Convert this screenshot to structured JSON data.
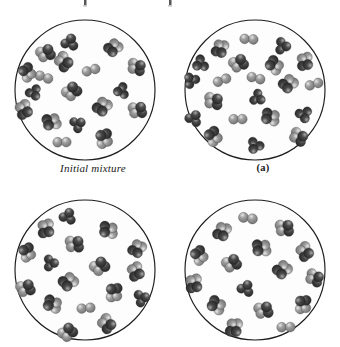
{
  "figure": {
    "kind": "molecular-illustration",
    "background_color": "#ffffff",
    "vessel_outline_color": "#1d1d1d",
    "vessel_fill_color": "#fdfdfd",
    "atom_light_color": "#9e9e9e",
    "atom_dark_color": "#4a4a4a",
    "atom_outline_color": "#2b2b2b",
    "panels": [
      {
        "id": "panel-initial",
        "label": "Initial mixture",
        "label_style": "italic",
        "x": 8,
        "y": 12,
        "molecules": [
          {
            "cx": 54,
            "cy": 22,
            "type": "dark-triatomic",
            "r": 6.0,
            "rot": 15
          },
          {
            "cx": 30,
            "cy": 33,
            "type": "mixed-tetratomic",
            "r": 6.2,
            "rot": 40
          },
          {
            "cx": 97,
            "cy": 28,
            "type": "mixed-tetratomic",
            "r": 6.0,
            "rot": 200
          },
          {
            "cx": 48,
            "cy": 42,
            "type": "mixed-tetratomic",
            "r": 6.3,
            "rot": 110
          },
          {
            "cx": 28,
            "cy": 57,
            "type": "light-diatomic",
            "r": 6.0,
            "rot": 25
          },
          {
            "cx": 11,
            "cy": 52,
            "type": "mixed-tetratomic",
            "r": 6.0,
            "rot": 300
          },
          {
            "cx": 75,
            "cy": 50,
            "type": "light-diatomic",
            "r": 6.0,
            "rot": 350
          },
          {
            "cx": 121,
            "cy": 47,
            "type": "mixed-tetratomic",
            "r": 6.0,
            "rot": 75
          },
          {
            "cx": 18,
            "cy": 73,
            "type": "dark-triatomic",
            "r": 5.6,
            "rot": 150
          },
          {
            "cx": 56,
            "cy": 71,
            "type": "mixed-tetratomic",
            "r": 6.3,
            "rot": 20
          },
          {
            "cx": 105,
            "cy": 71,
            "type": "dark-triatomic",
            "r": 5.6,
            "rot": 260
          },
          {
            "cx": 8,
            "cy": 90,
            "type": "mixed-tetratomic",
            "r": 6.2,
            "rot": 130
          },
          {
            "cx": 86,
            "cy": 87,
            "type": "mixed-tetratomic",
            "r": 6.3,
            "rot": 190
          },
          {
            "cx": 122,
            "cy": 90,
            "type": "mixed-tetratomic",
            "r": 6.1,
            "rot": 55
          },
          {
            "cx": 35,
            "cy": 102,
            "type": "mixed-tetratomic",
            "r": 6.2,
            "rot": 230
          },
          {
            "cx": 62,
            "cy": 104,
            "type": "dark-triatomic",
            "r": 5.6,
            "rot": 60
          },
          {
            "cx": 46,
            "cy": 122,
            "type": "light-diatomic",
            "r": 6.0,
            "rot": 5
          },
          {
            "cx": 88,
            "cy": 118,
            "type": "mixed-tetratomic",
            "r": 6.3,
            "rot": 320
          }
        ]
      },
      {
        "id": "panel-a",
        "label": "(a)",
        "label_style": "bold",
        "x": 178,
        "y": 12,
        "molecules": [
          {
            "cx": 63,
            "cy": 19,
            "type": "light-diatomic",
            "r": 6.0,
            "rot": 10
          },
          {
            "cx": 34,
            "cy": 29,
            "type": "mixed-tetratomic",
            "r": 6.0,
            "rot": 170
          },
          {
            "cx": 97,
            "cy": 26,
            "type": "dark-triatomic",
            "r": 5.8,
            "rot": 95
          },
          {
            "cx": 14,
            "cy": 44,
            "type": "dark-triatomic",
            "r": 5.8,
            "rot": 240
          },
          {
            "cx": 53,
            "cy": 43,
            "type": "mixed-tetratomic",
            "r": 6.2,
            "rot": 35
          },
          {
            "cx": 88,
            "cy": 45,
            "type": "mixed-tetratomic",
            "r": 6.1,
            "rot": 280
          },
          {
            "cx": 119,
            "cy": 42,
            "type": "mixed-tetratomic",
            "r": 6.0,
            "rot": 145
          },
          {
            "cx": 5,
            "cy": 60,
            "type": "dark-triatomic",
            "r": 5.6,
            "rot": 320
          },
          {
            "cx": 36,
            "cy": 60,
            "type": "light-diatomic",
            "r": 6.0,
            "rot": 345
          },
          {
            "cx": 70,
            "cy": 58,
            "type": "light-diatomic",
            "r": 6.0,
            "rot": 20
          },
          {
            "cx": 102,
            "cy": 64,
            "type": "mixed-tetratomic",
            "r": 6.2,
            "rot": 200
          },
          {
            "cx": 128,
            "cy": 64,
            "type": "light-diatomic",
            "r": 6.0,
            "rot": 350
          },
          {
            "cx": 28,
            "cy": 81,
            "type": "mixed-tetratomic",
            "r": 6.2,
            "rot": 70
          },
          {
            "cx": 72,
            "cy": 78,
            "type": "dark-triatomic",
            "r": 5.6,
            "rot": 120
          },
          {
            "cx": 8,
            "cy": 98,
            "type": "dark-triatomic",
            "r": 5.8,
            "rot": 30
          },
          {
            "cx": 52,
            "cy": 99,
            "type": "light-diatomic",
            "r": 6.0,
            "rot": 5
          },
          {
            "cx": 84,
            "cy": 97,
            "type": "mixed-tetratomic",
            "r": 6.2,
            "rot": 255
          },
          {
            "cx": 118,
            "cy": 95,
            "type": "dark-triatomic",
            "r": 5.8,
            "rot": 165
          },
          {
            "cx": 27,
            "cy": 116,
            "type": "mixed-tetratomic",
            "r": 6.2,
            "rot": 300
          },
          {
            "cx": 113,
            "cy": 117,
            "type": "mixed-tetratomic",
            "r": 6.1,
            "rot": 90
          },
          {
            "cx": 69,
            "cy": 126,
            "type": "dark-triatomic",
            "r": 5.8,
            "rot": 210
          }
        ]
      },
      {
        "id": "panel-b",
        "label": "",
        "label_style": "bold",
        "x": 8,
        "y": 192,
        "molecules": [
          {
            "cx": 52,
            "cy": 16,
            "type": "dark-triatomic",
            "r": 5.8,
            "rot": 20
          },
          {
            "cx": 30,
            "cy": 29,
            "type": "mixed-tetratomic",
            "r": 6.2,
            "rot": 145
          },
          {
            "cx": 92,
            "cy": 30,
            "type": "mixed-tetratomic",
            "r": 6.2,
            "rot": 250
          },
          {
            "cx": 59,
            "cy": 44,
            "type": "mixed-tetratomic",
            "r": 6.2,
            "rot": 60
          },
          {
            "cx": 11,
            "cy": 52,
            "type": "mixed-tetratomic",
            "r": 6.0,
            "rot": 310
          },
          {
            "cx": 121,
            "cy": 49,
            "type": "mixed-tetratomic",
            "r": 6.0,
            "rot": 185
          },
          {
            "cx": 35,
            "cy": 63,
            "type": "dark-triatomic",
            "r": 5.6,
            "rot": 90
          },
          {
            "cx": 84,
            "cy": 66,
            "type": "mixed-tetratomic",
            "r": 6.3,
            "rot": 25
          },
          {
            "cx": 120,
            "cy": 72,
            "type": "mixed-tetratomic",
            "r": 6.1,
            "rot": 130
          },
          {
            "cx": 52,
            "cy": 82,
            "type": "mixed-tetratomic",
            "r": 6.3,
            "rot": 205
          },
          {
            "cx": 10,
            "cy": 88,
            "type": "mixed-tetratomic",
            "r": 6.2,
            "rot": 45
          },
          {
            "cx": 98,
            "cy": 92,
            "type": "mixed-tetratomic",
            "r": 6.2,
            "rot": 330
          },
          {
            "cx": 126,
            "cy": 98,
            "type": "dark-triatomic",
            "r": 5.8,
            "rot": 75
          },
          {
            "cx": 36,
            "cy": 104,
            "type": "mixed-tetratomic",
            "r": 6.2,
            "rot": 260
          },
          {
            "cx": 70,
            "cy": 108,
            "type": "light-diatomic",
            "r": 6.0,
            "rot": 0
          },
          {
            "cx": 91,
            "cy": 124,
            "type": "mixed-tetratomic",
            "r": 6.2,
            "rot": 110
          },
          {
            "cx": 52,
            "cy": 132,
            "type": "mixed-tetratomic",
            "r": 6.2,
            "rot": 20
          }
        ]
      },
      {
        "id": "panel-c",
        "label": "",
        "label_style": "bold",
        "x": 178,
        "y": 192,
        "molecules": [
          {
            "cx": 62,
            "cy": 18,
            "type": "light-diatomic",
            "r": 6.2,
            "rot": 15
          },
          {
            "cx": 36,
            "cy": 32,
            "type": "mixed-tetratomic",
            "r": 6.2,
            "rot": 175
          },
          {
            "cx": 99,
            "cy": 28,
            "type": "mixed-tetratomic",
            "r": 6.2,
            "rot": 60
          },
          {
            "cx": 75,
            "cy": 48,
            "type": "mixed-tetratomic",
            "r": 6.3,
            "rot": 240
          },
          {
            "cx": 13,
            "cy": 55,
            "type": "mixed-tetratomic",
            "r": 6.1,
            "rot": 300
          },
          {
            "cx": 119,
            "cy": 52,
            "type": "mixed-tetratomic",
            "r": 6.1,
            "rot": 120
          },
          {
            "cx": 46,
            "cy": 63,
            "type": "mixed-tetratomic",
            "r": 6.2,
            "rot": 35
          },
          {
            "cx": 96,
            "cy": 70,
            "type": "mixed-tetratomic",
            "r": 6.2,
            "rot": 200
          },
          {
            "cx": 129,
            "cy": 78,
            "type": "mixed-tetratomic",
            "r": 6.0,
            "rot": 85
          },
          {
            "cx": 8,
            "cy": 84,
            "type": "mixed-tetratomic",
            "r": 6.2,
            "rot": 145
          },
          {
            "cx": 60,
            "cy": 88,
            "type": "dark-triatomic",
            "r": 5.8,
            "rot": 25
          },
          {
            "cx": 30,
            "cy": 105,
            "type": "mixed-tetratomic",
            "r": 6.2,
            "rot": 270
          },
          {
            "cx": 78,
            "cy": 110,
            "type": "mixed-tetratomic",
            "r": 6.2,
            "rot": 50
          },
          {
            "cx": 117,
            "cy": 104,
            "type": "mixed-tetratomic",
            "r": 6.1,
            "rot": 330
          },
          {
            "cx": 100,
            "cy": 127,
            "type": "light-diatomic",
            "r": 6.0,
            "rot": 5
          },
          {
            "cx": 48,
            "cy": 128,
            "type": "mixed-tetratomic",
            "r": 6.2,
            "rot": 160
          }
        ]
      }
    ]
  }
}
